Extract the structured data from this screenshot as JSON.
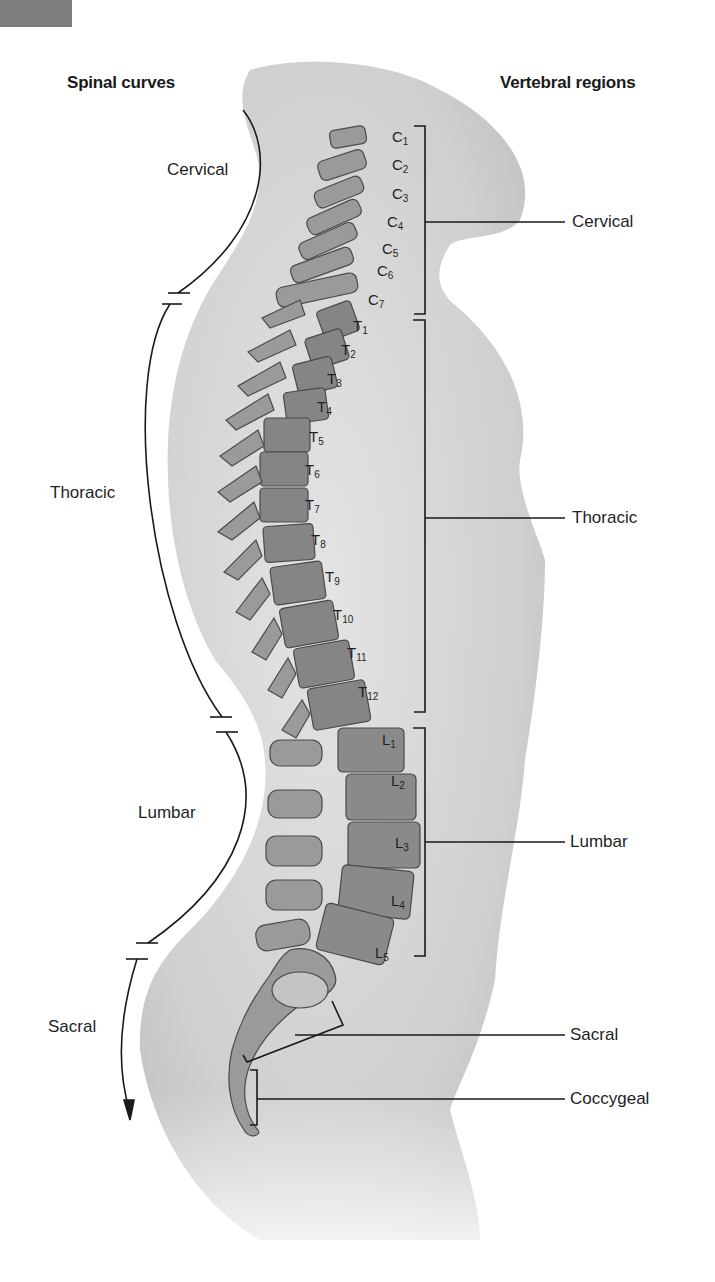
{
  "headings": {
    "left": "Spinal curves",
    "right": "Vertebral regions"
  },
  "curves": [
    {
      "label": "Cervical"
    },
    {
      "label": "Thoracic"
    },
    {
      "label": "Lumbar"
    },
    {
      "label": "Sacral"
    }
  ],
  "regions": [
    {
      "label": "Cervical"
    },
    {
      "label": "Thoracic"
    },
    {
      "label": "Lumbar"
    },
    {
      "label": "Sacral"
    },
    {
      "label": "Coccygeal"
    }
  ],
  "vertebrae": {
    "cervical": [
      {
        "letter": "C",
        "num": "1"
      },
      {
        "letter": "C",
        "num": "2"
      },
      {
        "letter": "C",
        "num": "3"
      },
      {
        "letter": "C",
        "num": "4"
      },
      {
        "letter": "C",
        "num": "5"
      },
      {
        "letter": "C",
        "num": "6"
      },
      {
        "letter": "C",
        "num": "7"
      }
    ],
    "thoracic": [
      {
        "letter": "T",
        "num": "1"
      },
      {
        "letter": "T",
        "num": "2"
      },
      {
        "letter": "T",
        "num": "3"
      },
      {
        "letter": "T",
        "num": "4"
      },
      {
        "letter": "T",
        "num": "5"
      },
      {
        "letter": "T",
        "num": "6"
      },
      {
        "letter": "T",
        "num": "7"
      },
      {
        "letter": "T",
        "num": "8"
      },
      {
        "letter": "T",
        "num": "9"
      },
      {
        "letter": "T",
        "num": "10"
      },
      {
        "letter": "T",
        "num": "11"
      },
      {
        "letter": "T",
        "num": "12"
      }
    ],
    "lumbar": [
      {
        "letter": "L",
        "num": "1"
      },
      {
        "letter": "L",
        "num": "2"
      },
      {
        "letter": "L",
        "num": "3"
      },
      {
        "letter": "L",
        "num": "4"
      },
      {
        "letter": "L",
        "num": "5"
      }
    ]
  },
  "colors": {
    "body_fill": "#d8d8d8",
    "bone_fill": "#9a9a9a",
    "bone_dark": "#6e6e6e",
    "line": "#1a1a1a"
  }
}
